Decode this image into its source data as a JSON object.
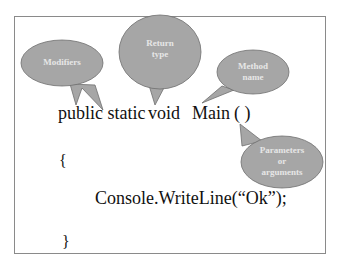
{
  "diagram": {
    "code_lines": {
      "signature_public_static": "public static",
      "signature_void": "void",
      "signature_main": "Main",
      "signature_parens": "( )",
      "open_brace": "{",
      "body": "Console.WriteLine(“Ok”);",
      "close_brace": "}"
    },
    "callouts": {
      "modifiers": "Modifiers",
      "return_type_line1": "Return",
      "return_type_line2": "type",
      "method_name_line1": "Method",
      "method_name_line2": "name",
      "params_line1": "Parameters",
      "params_line2": "or",
      "params_line3": "arguments"
    },
    "colors": {
      "bubble_fill": "#a6a6a6",
      "bubble_stroke": "#6e6e6e",
      "bubble_text": "#e6e6e6",
      "frame_border": "#8a8a8a",
      "code_text": "#111111"
    }
  }
}
